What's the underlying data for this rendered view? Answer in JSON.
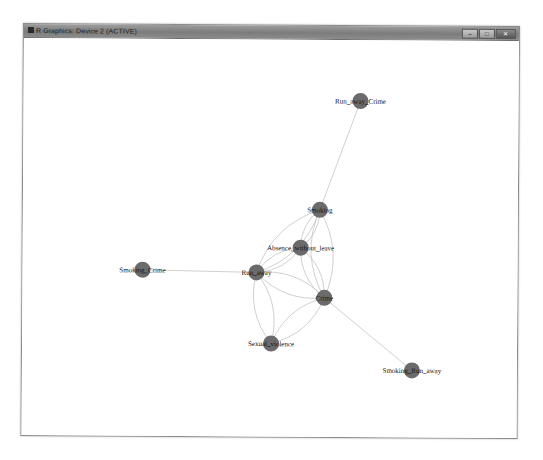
{
  "window": {
    "title": "R Graphics: Device 2 (ACTIVE)",
    "icon": "r-graphics-icon",
    "buttons": {
      "minimize": "–",
      "maximize": "□",
      "close": "✕"
    }
  },
  "graph": {
    "node_color": "#6b6b6b",
    "edge_color": "#c4c4c4",
    "nodes": [
      {
        "id": "Run_away_Crime",
        "label": "Run_away_Crime",
        "x": 360,
        "y": 98
      },
      {
        "id": "Smoking",
        "label": "Smoking",
        "x": 320,
        "y": 207
      },
      {
        "id": "Absence_without_leave",
        "label": "Absence_without_leave",
        "x": 301,
        "y": 245
      },
      {
        "id": "Smoking_Crime",
        "label": "Smoking_Crime",
        "x": 143,
        "y": 268
      },
      {
        "id": "Run_away",
        "label": "Run_away",
        "x": 257,
        "y": 270
      },
      {
        "id": "Crime",
        "label": "Crime",
        "x": 325,
        "y": 295
      },
      {
        "id": "Sexual_violence",
        "label": "Sexual_violence",
        "x": 272,
        "y": 341
      },
      {
        "id": "Smoking_Run_away",
        "label": "Smoking_Run_away",
        "x": 413,
        "y": 367
      }
    ],
    "edges": [
      {
        "from": "Run_away_Crime",
        "to": "Smoking"
      },
      {
        "from": "Smoking_Crime",
        "to": "Run_away"
      },
      {
        "from": "Crime",
        "to": "Smoking_Run_away"
      },
      {
        "from": "Smoking",
        "to": "Absence_without_leave"
      },
      {
        "from": "Smoking",
        "to": "Run_away"
      },
      {
        "from": "Smoking",
        "to": "Crime"
      },
      {
        "from": "Absence_without_leave",
        "to": "Run_away"
      },
      {
        "from": "Absence_without_leave",
        "to": "Crime"
      },
      {
        "from": "Run_away",
        "to": "Crime"
      },
      {
        "from": "Run_away",
        "to": "Sexual_violence"
      },
      {
        "from": "Crime",
        "to": "Sexual_violence"
      }
    ]
  }
}
